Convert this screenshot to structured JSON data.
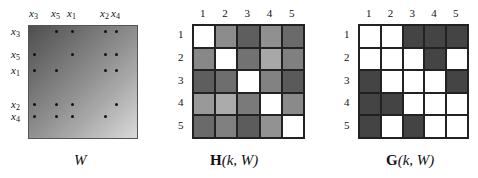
{
  "panels": {
    "W": {
      "caption": "W",
      "col_labels": [
        {
          "base": "x",
          "sub": "3",
          "x": 29
        },
        {
          "base": "x",
          "sub": "5",
          "x": 51
        },
        {
          "base": "x",
          "sub": "1",
          "x": 67
        },
        {
          "base": "x",
          "sub": "2",
          "x": 100
        },
        {
          "base": "x",
          "sub": "4",
          "x": 111
        }
      ],
      "row_labels": [
        {
          "base": "x",
          "sub": "3",
          "y": 26
        },
        {
          "base": "x",
          "sub": "5",
          "y": 49
        },
        {
          "base": "x",
          "sub": "1",
          "y": 65
        },
        {
          "base": "x",
          "sub": "2",
          "y": 99
        },
        {
          "base": "x",
          "sub": "4",
          "y": 111
        }
      ],
      "dot_cols": [
        34,
        56,
        72,
        105,
        116
      ],
      "dot_rows": [
        31,
        54,
        70,
        104,
        116
      ],
      "adjacency": [
        [
          0,
          1,
          1,
          1,
          1
        ],
        [
          1,
          0,
          1,
          1,
          1
        ],
        [
          1,
          1,
          0,
          1,
          1
        ],
        [
          1,
          1,
          1,
          0,
          1
        ],
        [
          1,
          1,
          1,
          1,
          0
        ]
      ],
      "gradient": {
        "dark": "#4f4f4f",
        "light": "#dadada"
      }
    },
    "H": {
      "caption_bold": "H",
      "caption_rest": "(k, W)",
      "col_labels": [
        "1",
        "2",
        "3",
        "4",
        "5"
      ],
      "row_labels": [
        "1",
        "2",
        "3",
        "4",
        "5"
      ],
      "cells": [
        [
          "#ffffff",
          "#8c8c8c",
          "#5e5e5e",
          "#909090",
          "#6a6a6a"
        ],
        [
          "#888888",
          "#ffffff",
          "#727272",
          "#a8a8a8",
          "#808080"
        ],
        [
          "#5e5e5e",
          "#6e6e6e",
          "#ffffff",
          "#828282",
          "#5a5a5a"
        ],
        [
          "#999999",
          "#ababab",
          "#7a7a7a",
          "#ffffff",
          "#8a8a8a"
        ],
        [
          "#6a6a6a",
          "#808080",
          "#5c5c5c",
          "#929292",
          "#ffffff"
        ]
      ]
    },
    "G": {
      "caption_bold": "G",
      "caption_rest": "(k, W)",
      "col_labels": [
        "1",
        "2",
        "3",
        "4",
        "5"
      ],
      "row_labels": [
        "1",
        "2",
        "3",
        "4",
        "5"
      ],
      "values": [
        [
          0,
          0,
          1,
          1,
          1
        ],
        [
          0,
          0,
          0,
          1,
          0
        ],
        [
          1,
          0,
          0,
          0,
          1
        ],
        [
          1,
          1,
          0,
          0,
          0
        ],
        [
          1,
          0,
          1,
          0,
          0
        ]
      ],
      "on_color": "#444444",
      "off_color": "#ffffff"
    }
  }
}
